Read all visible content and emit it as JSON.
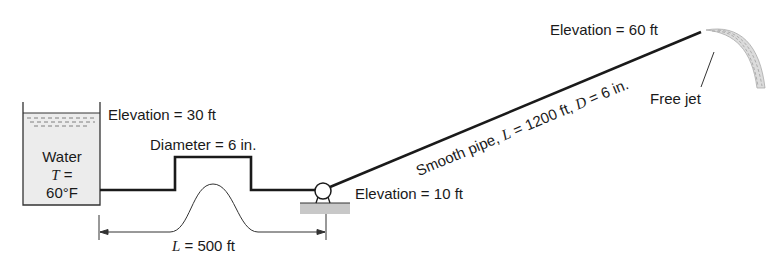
{
  "diagram": {
    "tank": {
      "label": "Water",
      "temp_var": "T",
      "temp_eq": " =",
      "temp_value": "60°F",
      "elevation_label": "Elevation = 30 ft"
    },
    "raised_section": {
      "diameter_label": "Diameter = 6 in."
    },
    "first_segment": {
      "length_var": "L",
      "length_label": " = 500 ft"
    },
    "pump": {
      "elevation_label": "Elevation = 10 ft"
    },
    "sloped_pipe": {
      "text_a": "Smooth pipe, ",
      "var_L": "L",
      "text_b": " = 1200 ft, ",
      "var_D": "D",
      "text_c": " = 6 in."
    },
    "outlet": {
      "elevation_label": "Elevation = 60 ft",
      "jet_label": "Free jet"
    },
    "colors": {
      "line": "#1a1a1a",
      "tank_fill": "#ececec",
      "ground_fill": "#c8c8c8"
    }
  }
}
